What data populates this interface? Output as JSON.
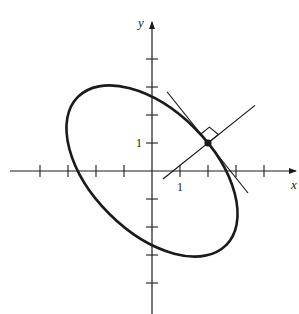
{
  "figure": {
    "colors": {
      "stroke": "#1a1a1a",
      "background": "#ffffff"
    }
  },
  "axes": {
    "x_label": "x",
    "y_label": "y",
    "x_tick_label": "1",
    "y_tick_label": "1",
    "origin_px": [
      152,
      171
    ],
    "unit_px": 28,
    "x_ticks": [
      -4,
      -3,
      -2,
      -1,
      1,
      2,
      3,
      4
    ],
    "y_ticks": [
      -4,
      -3,
      -2,
      -1,
      1,
      2,
      3,
      4
    ]
  },
  "curve": {
    "type": "ellipse",
    "equation": "x^2 + xy + y^2 = 7",
    "center": [
      0,
      0
    ],
    "rotation_deg": -45,
    "semi_major": 3.742,
    "semi_minor": 2.16
  },
  "point": {
    "x": 2,
    "y": 1
  },
  "tangent_line": {
    "slope": -1.25,
    "through": [
      2,
      1
    ]
  },
  "normal_line": {
    "slope": 0.8,
    "through": [
      2,
      1
    ]
  },
  "right_angle_marker": true
}
